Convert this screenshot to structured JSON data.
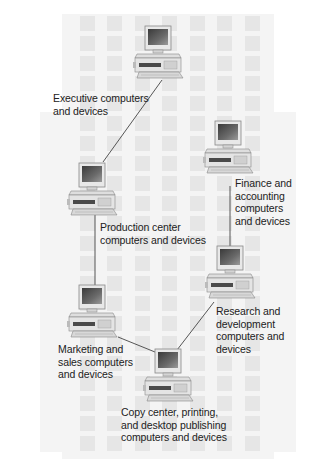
{
  "diagram": {
    "type": "network-ring",
    "background": {
      "color": "#ffffff",
      "tile_color": "#e6e6e6",
      "wash_color": "#f4f4f4"
    },
    "link_color": "#444444",
    "nodes": [
      {
        "id": "executive",
        "label": "Executive computers\nand devices",
        "icon": "desktop-computer-icon"
      },
      {
        "id": "production",
        "label": "Production center\ncomputers and devices",
        "icon": "desktop-computer-icon"
      },
      {
        "id": "marketing",
        "label": "Marketing and\nsales computers\nand devices",
        "icon": "desktop-computer-icon"
      },
      {
        "id": "copy",
        "label": "Copy center, printing,\nand desktop publishing\ncomputers and devices",
        "icon": "desktop-computer-icon"
      },
      {
        "id": "research",
        "label": "Research and\ndevelopment\ncomputers and\ndevices",
        "icon": "desktop-computer-icon"
      },
      {
        "id": "finance",
        "label": "Finance and\naccounting\ncomputers\nand devices",
        "icon": "desktop-computer-icon"
      }
    ],
    "links": [
      [
        "executive",
        "production"
      ],
      [
        "production",
        "marketing"
      ],
      [
        "marketing",
        "copy"
      ],
      [
        "copy",
        "research"
      ],
      [
        "research",
        "finance"
      ]
    ]
  }
}
